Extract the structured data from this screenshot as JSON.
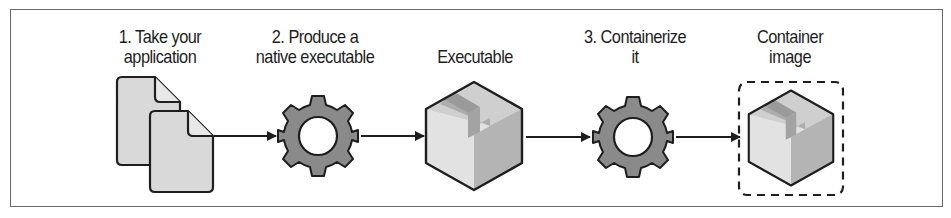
{
  "diagram": {
    "steps": [
      {
        "id": "source",
        "label_line1": "1. Take your",
        "label_line2": "application",
        "icon": "documents-icon"
      },
      {
        "id": "build",
        "label_line1": "2. Produce a",
        "label_line2": "native executable",
        "icon": "gear-icon"
      },
      {
        "id": "executable",
        "label_line1": "Executable",
        "label_line2": "",
        "icon": "box-icon"
      },
      {
        "id": "containerize",
        "label_line1": "3. Containerize",
        "label_line2": "it",
        "icon": "gear-icon"
      },
      {
        "id": "image",
        "label_line1": "Container",
        "label_line2": "image",
        "icon": "dashed-box-icon"
      }
    ],
    "colors": {
      "stroke": "#1e1e1e",
      "gear_fill": "#8a8a8a",
      "doc_fill": "#d9d9d9",
      "box_front": "#e2e2e2",
      "box_side": "#b4b4b4",
      "box_top": "#cfcfcf",
      "box_tape": "#9a9a9a",
      "frame": "#6a6a6a"
    }
  }
}
